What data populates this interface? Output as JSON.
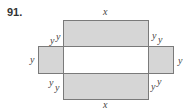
{
  "problem_number": "91.",
  "labels": {
    "top_x": "x",
    "bottom_x": "x",
    "top_left_outer": "y",
    "top_left_inner": "y",
    "top_right_inner": "y",
    "top_right_outer": "y",
    "left_side": "y",
    "right_side": "y",
    "bottom_left_outer": "y",
    "bottom_left_inner": "y",
    "bottom_right_inner": "y",
    "bottom_right_outer": "y"
  },
  "colors": {
    "shaded_fill": "#d6d6d6",
    "border": "#7a7a7a",
    "center_fill": "#ffffff"
  }
}
